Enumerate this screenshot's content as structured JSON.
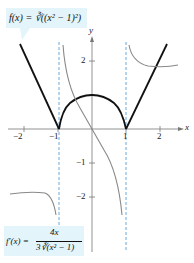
{
  "figure": {
    "f_label": "f(x) = ∛((x² − 1)²)",
    "fprime_lhs": "f′(x) =",
    "fprime_num": "4x",
    "fprime_den": "3∛(x² − 1)",
    "axis_x_label": "x",
    "axis_y_label": "y",
    "x_ticks": [
      "−2",
      "−1",
      "1",
      "2"
    ],
    "y_ticks": [
      "2",
      "−1",
      "−2"
    ],
    "colors": {
      "f": "#111111",
      "fprime": "#888888",
      "asymptote": "#5aa0d8",
      "box": "#e3f4fa"
    }
  }
}
